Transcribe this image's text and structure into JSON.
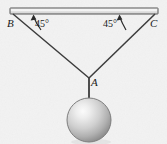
{
  "figure": {
    "background_color": "#f2f2f2",
    "line_color": "#3c3c3c",
    "labels": {
      "point_b": "B",
      "point_c": "C",
      "point_a": "A",
      "angle_left": "45°",
      "angle_right": "45°"
    },
    "ceiling_bar": {
      "fill_color": "#e8e8e8",
      "stroke_color": "#555555",
      "x": 10,
      "y": 8,
      "width": 148,
      "height": 6
    },
    "cords": {
      "left": {
        "x1": 13,
        "y1": 14,
        "x2": 89,
        "y2": 78
      },
      "right": {
        "x1": 155,
        "y1": 14,
        "x2": 89,
        "y2": 78
      },
      "vertical": {
        "x1": 89,
        "y1": 78,
        "x2": 89,
        "y2": 101
      }
    },
    "sphere": {
      "center_x": 89,
      "center_y": 120,
      "radius": 22,
      "highlight_color": "#f4f4f4",
      "mid_color": "#b9b9b9",
      "edge_color": "#8c8c8c"
    },
    "angle_arcs": {
      "left_arrow_from": {
        "x": 41,
        "y": 29
      },
      "left_arrow_to": {
        "x": 33,
        "y": 15
      },
      "right_arrow_from": {
        "x": 126,
        "y": 29
      },
      "right_arrow_to": {
        "x": 119,
        "y": 15
      }
    }
  }
}
